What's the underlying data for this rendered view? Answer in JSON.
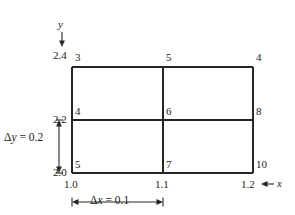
{
  "figure": {
    "type": "grid-diagram",
    "line_color": "#262626",
    "background": "#ffffff",
    "axes": {
      "x": {
        "label": "x",
        "arrow": "←",
        "direction": "left",
        "ticks": [
          "1.0",
          "1.1",
          "1.2"
        ]
      },
      "y": {
        "label": "y",
        "arrow": "↓",
        "direction": "down",
        "ticks": [
          "2.4",
          "2.2",
          "2.0"
        ]
      }
    },
    "spacing": {
      "dx_label": "Δx = 0.1",
      "dx_delta": "Δ",
      "dx_var": "x",
      "dx_value": "= 0.1",
      "dy_label": "Δy = 0.2",
      "dy_delta": "Δ",
      "dy_var": "y",
      "dy_value": "= 0.2"
    },
    "nodes": [
      {
        "id": "3",
        "row": "top",
        "col": "left"
      },
      {
        "id": "5",
        "row": "top",
        "col": "middle"
      },
      {
        "id": "4",
        "row": "top",
        "col": "right"
      },
      {
        "id": "4b",
        "label": "4",
        "row": "middle",
        "col": "left"
      },
      {
        "id": "6",
        "row": "middle",
        "col": "middle"
      },
      {
        "id": "8",
        "row": "middle",
        "col": "right"
      },
      {
        "id": "5b",
        "label": "5",
        "row": "bottom",
        "col": "left"
      },
      {
        "id": "7",
        "row": "bottom",
        "col": "middle"
      },
      {
        "id": "10",
        "row": "bottom",
        "col": "right"
      }
    ],
    "node_labels": {
      "top_left": "3",
      "top_middle": "5",
      "top_right": "4",
      "mid_left": "4",
      "mid_middle": "6",
      "mid_right": "8",
      "bot_left": "5",
      "bot_middle": "7",
      "bot_right": "10"
    }
  }
}
